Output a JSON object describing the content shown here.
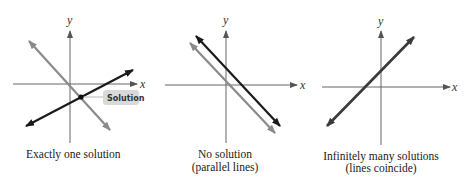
{
  "colors": {
    "axis": "#555555",
    "gray_line": "#8a8a8a",
    "black_line": "#1a1a1a",
    "label_bg": "#d9d9d9"
  },
  "panels": [
    {
      "id": "one-solution",
      "axis_labels": {
        "x": "x",
        "y": "y"
      },
      "annotation": "Solution",
      "caption": [
        "Exactly one solution"
      ]
    },
    {
      "id": "no-solution",
      "axis_labels": {
        "x": "x",
        "y": "y"
      },
      "caption": [
        "No solution",
        "(parallel lines)"
      ]
    },
    {
      "id": "infinite-solutions",
      "axis_labels": {
        "x": "x",
        "y": "y"
      },
      "caption": [
        "Infinitely many solutions",
        "(lines coincide)"
      ]
    }
  ]
}
